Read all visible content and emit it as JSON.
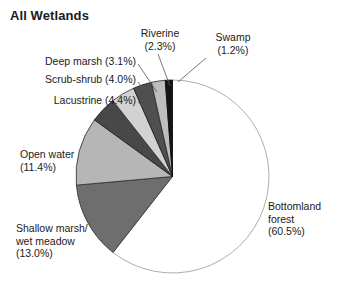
{
  "chart": {
    "title": "All Wetlands"
  },
  "chart_data": {
    "type": "pie",
    "title": "All Wetlands",
    "xlabel": "",
    "ylabel": "",
    "units": "percent",
    "legend_position": "callout-labels",
    "grid": false,
    "start_angle_deg": 0,
    "direction": "clockwise",
    "categories": [
      "Bottomland forest",
      "Shallow marsh/ wet meadow",
      "Open water",
      "Lacustrine",
      "Scrub-shrub",
      "Deep marsh",
      "Riverine",
      "Swamp"
    ],
    "values": [
      60.5,
      13.0,
      11.4,
      4.4,
      4.0,
      3.1,
      2.3,
      1.2
    ],
    "slices": [
      {
        "name": "Bottomland forest",
        "value": 60.5,
        "percent_text": "(60.5%)",
        "label_line1": "Bottomland",
        "label_line2": "forest",
        "label_line3": "(60.5%)",
        "color": "#ffffff",
        "stroke": "#8a8a8a"
      },
      {
        "name": "Shallow marsh/ wet meadow",
        "value": 13.0,
        "percent_text": "(13.0%)",
        "label_line1": "Shallow marsh/",
        "label_line2": "wet meadow",
        "label_line3": "(13.0%)",
        "color": "#6e6e6e",
        "stroke": "#2b2b2b"
      },
      {
        "name": "Open water",
        "value": 11.4,
        "percent_text": "(11.4%)",
        "label_line1": "Open water",
        "label_line2": "(11.4%)",
        "label_line3": "",
        "color": "#b6b6b6",
        "stroke": "#2b2b2b"
      },
      {
        "name": "Lacustrine",
        "value": 4.4,
        "percent_text": "(4.4%)",
        "label_line1": "Lacustrine (4.4%)",
        "label_line2": "",
        "label_line3": "",
        "color": "#484848",
        "stroke": "#1c1c1c"
      },
      {
        "name": "Scrub-shrub",
        "value": 4.0,
        "percent_text": "(4.0%)",
        "label_line1": "Scrub-shrub (4.0%)",
        "label_line2": "",
        "label_line3": "",
        "color": "#d2d2d2",
        "stroke": "#2b2b2b"
      },
      {
        "name": "Deep marsh",
        "value": 3.1,
        "percent_text": "(3.1%)",
        "label_line1": "Deep marsh (3.1%)",
        "label_line2": "",
        "label_line3": "",
        "color": "#4f4f4f",
        "stroke": "#1c1c1c"
      },
      {
        "name": "Riverine",
        "value": 2.3,
        "percent_text": "(2.3%)",
        "label_line1": "Riverine",
        "label_line2": "(2.3%)",
        "label_line3": "",
        "color": "#bdbdbd",
        "stroke": "#2b2b2b"
      },
      {
        "name": "Swamp",
        "value": 1.2,
        "percent_text": "(1.2%)",
        "label_line1": "Swamp",
        "label_line2": "(1.2%)",
        "label_line3": "",
        "color": "#141414",
        "stroke": "#0a0a0a"
      }
    ]
  },
  "labels": {
    "riverine": "Riverine\n(2.3%)",
    "swamp": "Swamp\n(1.2%)",
    "deep_marsh": "Deep marsh (3.1%)",
    "scrub_shrub": "Scrub-shrub (4.0%)",
    "lacustrine": "Lacustrine (4.4%)",
    "open_water": "Open water\n(11.4%)",
    "shallow_marsh": "Shallow marsh/\nwet meadow\n(13.0%)",
    "bottomland": "Bottomland\nforest\n(60.5%)"
  }
}
